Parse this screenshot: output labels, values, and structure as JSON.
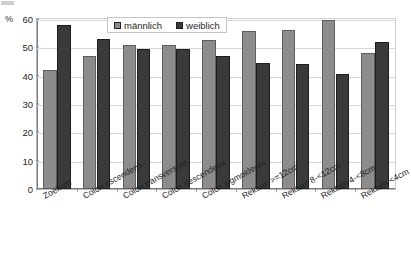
{
  "chart_data": {
    "type": "bar",
    "title": "",
    "subtitle": "",
    "xlabel": "",
    "ylabel": "%",
    "ylim": [
      0,
      60
    ],
    "yticks": [
      0,
      10,
      20,
      30,
      40,
      50,
      60
    ],
    "ytick_labels": [
      "0",
      "10",
      "20",
      "30",
      "40",
      "50",
      "60"
    ],
    "grid": true,
    "legend_position": "top-center",
    "categories": [
      "Zoekum",
      "Colon ascendens",
      "Colon transversum",
      "Colon descendens",
      "Colon sigmoideum",
      "Rektum >=12cm",
      "Rektum 8-<12cm",
      "Rektum 4-<8cm",
      "Rektum <4cm"
    ],
    "series": [
      {
        "name": "männlich",
        "color": "#8c8c8c",
        "values": [
          42.0,
          47.0,
          50.7,
          50.7,
          52.5,
          55.7,
          56.0,
          59.5,
          48.0
        ]
      },
      {
        "name": "weiblich",
        "color": "#3a3a3a",
        "values": [
          58.0,
          53.0,
          49.3,
          49.3,
          47.0,
          44.3,
          44.0,
          40.5,
          52.0
        ]
      }
    ]
  },
  "axis": {
    "percent_symbol": "%"
  }
}
